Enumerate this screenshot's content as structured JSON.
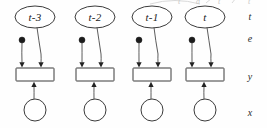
{
  "figure": {
    "width": 267,
    "height": 128,
    "background_color": "#fefefe",
    "line_color": "#3b3b3b",
    "node_fill": "#ffffff",
    "dot_color": "#1c1c1c"
  },
  "slices": [
    {
      "id": "slice-1",
      "ellipse_label": "t-3",
      "center_x": 35,
      "ellipse_cy": 17,
      "dot_x": 22,
      "dot_y": 40,
      "rect_x": 16,
      "rect_y": 68,
      "circle_cx": 35,
      "circle_cy": 110
    },
    {
      "id": "slice-2",
      "ellipse_label": "t-2",
      "center_x": 95,
      "ellipse_cy": 17,
      "dot_x": 82,
      "dot_y": 40,
      "rect_x": 76,
      "rect_y": 68,
      "circle_cx": 95,
      "circle_cy": 110
    },
    {
      "id": "slice-3",
      "ellipse_label": "t-1",
      "center_x": 152,
      "ellipse_cy": 17,
      "dot_x": 139,
      "dot_y": 40,
      "rect_x": 133,
      "rect_y": 68,
      "circle_cx": 152,
      "circle_cy": 110
    },
    {
      "id": "slice-4",
      "ellipse_label": "t",
      "center_x": 205,
      "ellipse_cy": 17,
      "dot_x": 192,
      "dot_y": 40,
      "rect_x": 186,
      "rect_y": 68,
      "circle_cx": 205,
      "circle_cy": 110
    }
  ],
  "row_labels": [
    {
      "id": "row-label-t",
      "text": "t",
      "x": 250,
      "y": 20
    },
    {
      "id": "row-label-e",
      "text": "e",
      "x": 250,
      "y": 42
    },
    {
      "id": "row-label-y",
      "text": "y",
      "x": 250,
      "y": 80
    },
    {
      "id": "row-label-x",
      "text": "x",
      "x": 250,
      "y": 116
    }
  ],
  "geometry": {
    "ellipse_rx": 20,
    "ellipse_ry": 11,
    "rect_w": 38,
    "rect_h": 13,
    "circle_r": 11,
    "dot_r": 3
  },
  "artifacts": {
    "note": "faint clipped marks from preceding figure line at top edge"
  }
}
